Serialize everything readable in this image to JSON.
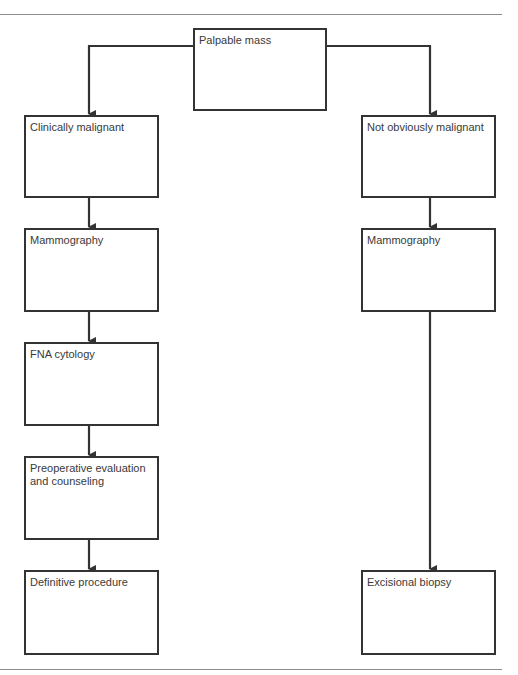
{
  "diagram": {
    "type": "flowchart",
    "colors": {
      "line": "#333333",
      "text": "#3a3a3a",
      "rule": "#8c8c8c",
      "background": "#ffffff"
    },
    "root": {
      "id": "palpable-mass",
      "label": "Palpable mass"
    },
    "branches": {
      "left": {
        "nodes": [
          {
            "id": "clinically-malignant",
            "label": "Clinically malignant"
          },
          {
            "id": "mammography-left",
            "label": "Mammography"
          },
          {
            "id": "fna-cytology",
            "label": "FNA cytology"
          },
          {
            "id": "preoperative-evaluation",
            "label": "Preoperative evaluation\nand counseling"
          },
          {
            "id": "definitive-procedure",
            "label": "Definitive procedure"
          }
        ]
      },
      "right": {
        "nodes": [
          {
            "id": "not-obviously-malignant",
            "label": "Not obviously malignant"
          },
          {
            "id": "mammography-right",
            "label": "Mammography"
          },
          {
            "id": "excisional-biopsy",
            "label": "Excisional biopsy"
          }
        ]
      }
    },
    "edges": [
      [
        "palpable-mass",
        "clinically-malignant"
      ],
      [
        "palpable-mass",
        "not-obviously-malignant"
      ],
      [
        "clinically-malignant",
        "mammography-left"
      ],
      [
        "mammography-left",
        "fna-cytology"
      ],
      [
        "fna-cytology",
        "preoperative-evaluation"
      ],
      [
        "preoperative-evaluation",
        "definitive-procedure"
      ],
      [
        "not-obviously-malignant",
        "mammography-right"
      ],
      [
        "mammography-right",
        "excisional-biopsy"
      ]
    ]
  }
}
